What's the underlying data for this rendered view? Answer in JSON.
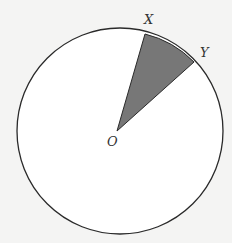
{
  "diagram": {
    "type": "circle-sector",
    "colors": {
      "background": "#f4f4f3",
      "circle_fill": "#ffffff",
      "stroke": "#2a2a2a",
      "sector_fill": "#777777"
    },
    "circle": {
      "cx": 120,
      "cy": 131,
      "r": 103
    },
    "points": {
      "O": {
        "label": "O",
        "x": 117,
        "y": 131
      },
      "X": {
        "label": "X",
        "x": 145,
        "y": 34
      },
      "Y": {
        "label": "Y",
        "x": 194,
        "y": 62
      }
    },
    "labels": {
      "O": "O",
      "X": "X",
      "Y": "Y"
    }
  }
}
